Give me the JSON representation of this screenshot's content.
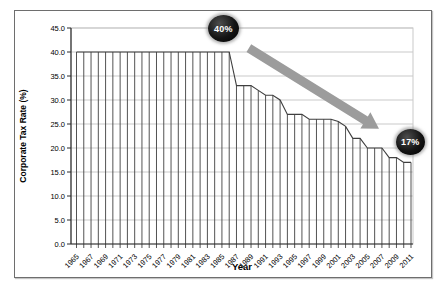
{
  "chart_data": {
    "type": "line",
    "line_style": "vertical-drop-lines",
    "title": "",
    "xlabel": "Year",
    "ylabel": "Corporate Tax Rate (%)",
    "ylim": [
      0,
      45
    ],
    "grid": true,
    "legend": false,
    "x": [
      1965,
      1966,
      1967,
      1968,
      1969,
      1970,
      1971,
      1972,
      1973,
      1974,
      1975,
      1976,
      1977,
      1978,
      1979,
      1980,
      1981,
      1982,
      1983,
      1984,
      1985,
      1986,
      1987,
      1988,
      1989,
      1990,
      1991,
      1992,
      1993,
      1994,
      1995,
      1996,
      1997,
      1998,
      1999,
      2000,
      2001,
      2002,
      2003,
      2004,
      2005,
      2006,
      2007,
      2008,
      2009,
      2010,
      2011
    ],
    "series": [
      {
        "name": "Corporate Tax Rate (%)",
        "values": [
          40,
          40,
          40,
          40,
          40,
          40,
          40,
          40,
          40,
          40,
          40,
          40,
          40,
          40,
          40,
          40,
          40,
          40,
          40,
          40,
          40,
          40,
          33,
          33,
          33,
          32,
          31,
          31,
          30,
          27,
          27,
          27,
          26,
          26,
          26,
          26,
          25.5,
          24.5,
          22,
          22,
          20,
          20,
          20,
          18,
          18,
          17,
          17
        ]
      }
    ],
    "ytick_labels": [
      "0.0",
      "5.0",
      "10.0",
      "15.0",
      "20.0",
      "25.0",
      "30.0",
      "35.0",
      "40.0",
      "45.0"
    ],
    "xtick_labels": [
      "1965",
      "1967",
      "1969",
      "1971",
      "1973",
      "1975",
      "1977",
      "1979",
      "1981",
      "1983",
      "1985",
      "1987",
      "1989",
      "1991",
      "1993",
      "1995",
      "1997",
      "1999",
      "2001",
      "2003",
      "2005",
      "2007",
      "2009",
      "2011"
    ],
    "annotations": [
      {
        "type": "badge",
        "label": "40%",
        "anchor_year": 1985.2,
        "anchor_value": 44.8
      },
      {
        "type": "badge",
        "label": "17%",
        "anchor_year": 2010.9,
        "anchor_value": 21.3
      },
      {
        "type": "arrow",
        "from_year": 1988.7,
        "from_value": 40.8,
        "to_year": 2006.6,
        "to_value": 24.0
      }
    ],
    "colors": {
      "line": "#3f3f3f",
      "grid": "#c9c9c9",
      "axis": "#2b2b2b",
      "plot_border": "#c9c9c9",
      "arrow": "#9c9c9c",
      "badge_bg": "#000000",
      "badge_text": "#ffffff"
    }
  }
}
